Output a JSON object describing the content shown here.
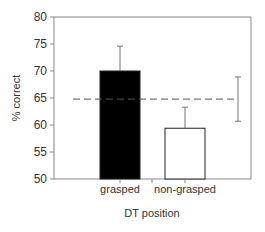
{
  "chart_data": {
    "type": "bar",
    "title": "",
    "xlabel": "DT position",
    "ylabel": "% correct",
    "categories": [
      "grasped",
      "non-grasped"
    ],
    "values": [
      70.0,
      59.4
    ],
    "error_upper": [
      74.6,
      63.3
    ],
    "bar_colors": [
      "#000000",
      "#ffffff"
    ],
    "ylim": [
      50,
      80
    ],
    "yticks": [
      50,
      55,
      60,
      65,
      70,
      75,
      80
    ],
    "grid": false,
    "legend": null,
    "reference_line": {
      "label": "chance / baseline",
      "value": 64.8,
      "style": "dashed",
      "error_range": [
        60.7,
        68.9
      ]
    }
  }
}
